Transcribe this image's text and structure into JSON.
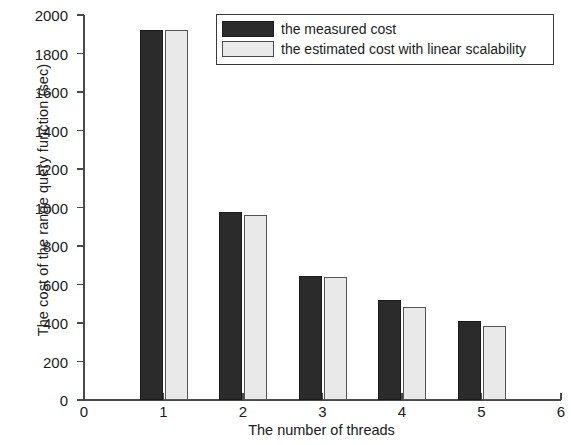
{
  "chart_data": {
    "type": "bar",
    "title": "",
    "subtitle": "",
    "xlabel": "The number of threads",
    "ylabel": "The cost of the range query function (sec)",
    "categories": [
      "1",
      "2",
      "3",
      "4",
      "5"
    ],
    "series": [
      {
        "name": "the measured cost",
        "color": "#2b2b2b",
        "values": [
          1920,
          975,
          645,
          520,
          408
        ]
      },
      {
        "name": "the estimated cost with linear scalability",
        "color": "#e9e9e9",
        "values": [
          1920,
          960,
          640,
          485,
          383
        ]
      }
    ],
    "xlim": [
      0,
      6
    ],
    "ylim": [
      0,
      2000
    ],
    "xticks": [
      "0",
      "1",
      "2",
      "3",
      "4",
      "5",
      "6"
    ],
    "yticks": [
      "0",
      "200",
      "400",
      "600",
      "800",
      "1000",
      "1200",
      "1400",
      "1600",
      "1800",
      "2000"
    ],
    "grid": false,
    "legend_position": "top-right"
  },
  "legend": {
    "entries": [
      {
        "label": "the measured cost",
        "swatch": "measured-swatch"
      },
      {
        "label": "the estimated cost with linear scalability",
        "swatch": "estimated-swatch"
      }
    ]
  }
}
